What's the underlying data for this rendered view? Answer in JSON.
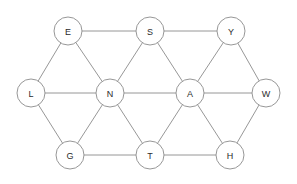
{
  "diagram": {
    "type": "node-link-graph",
    "background_color": "#ffffff",
    "edge_color": "#8b8b8b",
    "node_fill_color": "#ffffff",
    "node_stroke_color": "#8b8b8b",
    "label_color": "#2b2b2b",
    "node_radius": 14,
    "nodes": [
      {
        "id": "E",
        "label": "E",
        "x": 68,
        "y": 31
      },
      {
        "id": "S",
        "label": "S",
        "x": 150,
        "y": 31
      },
      {
        "id": "Y",
        "label": "Y",
        "x": 231,
        "y": 31
      },
      {
        "id": "L",
        "label": "L",
        "x": 31,
        "y": 93
      },
      {
        "id": "N",
        "label": "N",
        "x": 110,
        "y": 93
      },
      {
        "id": "A",
        "label": "A",
        "x": 190,
        "y": 93
      },
      {
        "id": "W",
        "label": "W",
        "x": 266,
        "y": 93
      },
      {
        "id": "G",
        "label": "G",
        "x": 70,
        "y": 155
      },
      {
        "id": "T",
        "label": "T",
        "x": 150,
        "y": 155
      },
      {
        "id": "H",
        "label": "H",
        "x": 230,
        "y": 155
      }
    ],
    "edges": [
      {
        "source": "E",
        "target": "S"
      },
      {
        "source": "S",
        "target": "Y"
      },
      {
        "source": "E",
        "target": "L"
      },
      {
        "source": "E",
        "target": "N"
      },
      {
        "source": "L",
        "target": "N"
      },
      {
        "source": "S",
        "target": "N"
      },
      {
        "source": "S",
        "target": "A"
      },
      {
        "source": "N",
        "target": "A"
      },
      {
        "source": "Y",
        "target": "A"
      },
      {
        "source": "Y",
        "target": "W"
      },
      {
        "source": "A",
        "target": "W"
      },
      {
        "source": "L",
        "target": "G"
      },
      {
        "source": "G",
        "target": "N"
      },
      {
        "source": "N",
        "target": "T"
      },
      {
        "source": "G",
        "target": "T"
      },
      {
        "source": "A",
        "target": "T"
      },
      {
        "source": "A",
        "target": "H"
      },
      {
        "source": "T",
        "target": "H"
      },
      {
        "source": "H",
        "target": "W"
      }
    ]
  }
}
